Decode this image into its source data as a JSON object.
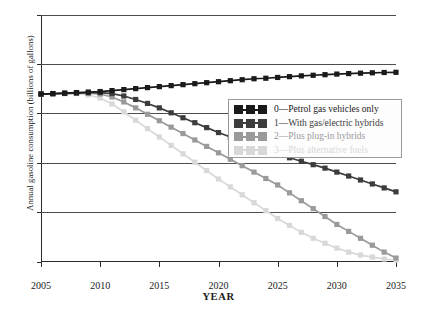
{
  "chart_data": {
    "type": "line",
    "title": "",
    "xlabel": "YEAR",
    "ylabel": "Annual gasoline consumption (billions of gallons)",
    "xlim": [
      2005,
      2035
    ],
    "ylim": [
      0,
      250
    ],
    "xticks": [
      2005,
      2010,
      2015,
      2020,
      2025,
      2030,
      2035
    ],
    "yticks": [
      0,
      50,
      100,
      150,
      200,
      250
    ],
    "grid": "horizontal",
    "legend_position": "center-right",
    "marker": "square",
    "x": [
      2005,
      2006,
      2007,
      2008,
      2009,
      2010,
      2011,
      2012,
      2013,
      2014,
      2015,
      2016,
      2017,
      2018,
      2019,
      2020,
      2021,
      2022,
      2023,
      2024,
      2025,
      2026,
      2027,
      2028,
      2029,
      2030,
      2031,
      2032,
      2033,
      2034,
      2035
    ],
    "series": [
      {
        "name": "0—Petrol gas vehicles only",
        "color": "#1a1a1a",
        "values": [
          170,
          170.5,
          171,
          171.5,
          172,
          172.5,
          173.5,
          174.5,
          175.5,
          176.5,
          177.5,
          178.5,
          179.5,
          180.5,
          181.5,
          182.5,
          183.5,
          184.5,
          185.5,
          186,
          186.8,
          187.6,
          188.4,
          189,
          189.6,
          190.2,
          190.7,
          191.1,
          191.5,
          191.8,
          192
        ]
      },
      {
        "name": "1—With gas/electric hybrids",
        "color": "#3c3c3c",
        "values": [
          170,
          170.3,
          170.6,
          171,
          171.3,
          171.5,
          170.5,
          168,
          164.5,
          160.5,
          156,
          151,
          146,
          141,
          136,
          131,
          126.5,
          122,
          117.5,
          113,
          109,
          105.5,
          102,
          98.5,
          95,
          91,
          87,
          83,
          79,
          75,
          71
        ]
      },
      {
        "name": "2—Plus plug-in hybrids",
        "color": "#9a9a9a",
        "values": [
          170,
          170.3,
          170.6,
          171,
          171,
          170,
          167,
          162,
          156,
          149.5,
          143,
          136.5,
          130,
          123.5,
          117,
          110.5,
          104,
          97.5,
          91,
          84.5,
          78,
          70,
          62,
          54,
          46,
          38,
          31,
          24,
          17,
          10,
          4
        ]
      },
      {
        "name": "3—Plus alternative fuels",
        "color": "#d8d8d8",
        "values": [
          170,
          170.3,
          170.6,
          170.5,
          169,
          166,
          160,
          152,
          143.5,
          135,
          126.5,
          118,
          109.5,
          101,
          92.5,
          84,
          76,
          68,
          60,
          52,
          44,
          37,
          30,
          24,
          19,
          14,
          10,
          7,
          5,
          3,
          2
        ]
      }
    ]
  },
  "axis": {
    "xtick_labels": [
      "2005",
      "2010",
      "2015",
      "2020",
      "2025",
      "2030",
      "2035"
    ],
    "ytick_labels": [
      "0",
      "50",
      "100",
      "150",
      "200",
      "250"
    ]
  },
  "legend": {
    "items": [
      {
        "label": "0—Petrol gas vehicles only",
        "color": "#1a1a1a"
      },
      {
        "label": "1—With gas/electric hybrids",
        "color": "#3c3c3c"
      },
      {
        "label": "2—Plus plug-in hybrids",
        "color": "#9a9a9a"
      },
      {
        "label": "3—Plus alternative fuels",
        "color": "#d8d8d8"
      }
    ]
  }
}
